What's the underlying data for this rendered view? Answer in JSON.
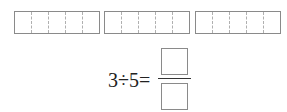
{
  "bars": [
    {
      "id": "bar-1",
      "left": 14,
      "width": 86,
      "cells": 5
    },
    {
      "id": "bar-2",
      "left": 104,
      "width": 86,
      "cells": 5
    },
    {
      "id": "bar-3",
      "left": 195,
      "width": 86,
      "cells": 5
    }
  ],
  "equation": {
    "text": "3÷5=",
    "dividend": "3",
    "operator": "÷",
    "divisor": "5",
    "equals": "=",
    "numerator": "",
    "denominator": ""
  },
  "colors": {
    "box_border": "#8a8a8a",
    "dashed_divider": "#b0b0b0",
    "text": "#222222"
  }
}
